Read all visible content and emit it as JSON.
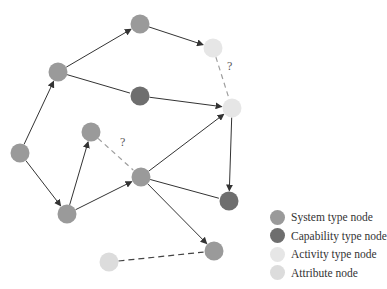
{
  "colors": {
    "system": "#9a9a9a",
    "capability": "#6e6e6e",
    "activity": "#e6e6e6",
    "attribute": "#dcdcdc",
    "edge": "#333333",
    "dashed_edge": "#9e9e9e"
  },
  "nodes": [
    {
      "id": "A",
      "type": "system",
      "x": 20,
      "y": 153
    },
    {
      "id": "B",
      "type": "system",
      "x": 58,
      "y": 72
    },
    {
      "id": "C",
      "type": "system",
      "x": 140,
      "y": 24
    },
    {
      "id": "D",
      "type": "activity",
      "x": 213,
      "y": 48
    },
    {
      "id": "E",
      "type": "capability",
      "x": 140,
      "y": 96
    },
    {
      "id": "F",
      "type": "activity",
      "x": 232,
      "y": 108
    },
    {
      "id": "G",
      "type": "system",
      "x": 91,
      "y": 132
    },
    {
      "id": "H",
      "type": "system",
      "x": 141,
      "y": 177
    },
    {
      "id": "I",
      "type": "system",
      "x": 67,
      "y": 214
    },
    {
      "id": "J",
      "type": "capability",
      "x": 229,
      "y": 201
    },
    {
      "id": "K",
      "type": "system",
      "x": 214,
      "y": 251
    },
    {
      "id": "L",
      "type": "attribute",
      "x": 109,
      "y": 262
    }
  ],
  "edges": [
    {
      "from": "A",
      "to": "B",
      "style": "arrow"
    },
    {
      "from": "B",
      "to": "C",
      "style": "arrow"
    },
    {
      "from": "C",
      "to": "D",
      "style": "arrow"
    },
    {
      "from": "B",
      "to": "E",
      "style": "line"
    },
    {
      "from": "E",
      "to": "F",
      "style": "arrow"
    },
    {
      "from": "D",
      "to": "F",
      "style": "dashed",
      "label": "?"
    },
    {
      "from": "A",
      "to": "I",
      "style": "arrow"
    },
    {
      "from": "I",
      "to": "G",
      "style": "arrow"
    },
    {
      "from": "I",
      "to": "H",
      "style": "arrow"
    },
    {
      "from": "G",
      "to": "H",
      "style": "dashed",
      "label": "?"
    },
    {
      "from": "H",
      "to": "F",
      "style": "arrow"
    },
    {
      "from": "F",
      "to": "J",
      "style": "arrow"
    },
    {
      "from": "H",
      "to": "J",
      "style": "line"
    },
    {
      "from": "H",
      "to": "K",
      "style": "arrow"
    },
    {
      "from": "L",
      "to": "K",
      "style": "dashed_dark"
    }
  ],
  "question_marks": [
    {
      "text": "?",
      "x": 227,
      "y": 67
    },
    {
      "text": "?",
      "x": 120,
      "y": 143
    }
  ],
  "legend": [
    {
      "type": "system",
      "label": "System type node"
    },
    {
      "type": "capability",
      "label": "Capability type node"
    },
    {
      "type": "activity",
      "label": "Activity type node"
    },
    {
      "type": "attribute",
      "label": "Attribute node"
    }
  ]
}
